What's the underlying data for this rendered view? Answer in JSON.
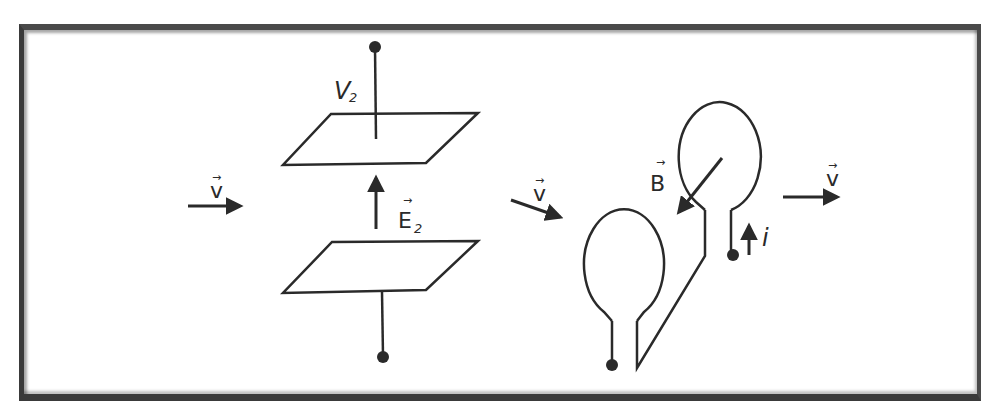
{
  "diagram": {
    "colors": {
      "stroke": "#2a2a2a",
      "frame": "#3a3a3a",
      "background": "#ffffff"
    },
    "labels": {
      "velocity_left": "v",
      "velocity_middle": "v",
      "velocity_right": "v",
      "vector_accent": "→",
      "voltage": "V",
      "voltage_subscript": "2",
      "electric_field": "E",
      "electric_field_subscript": "2",
      "magnetic_field": "B",
      "current": "i"
    },
    "components": {
      "capacitor": "parallel-plate capacitor with top and bottom terminals",
      "coil": "two-loop wire coil with terminals"
    }
  }
}
